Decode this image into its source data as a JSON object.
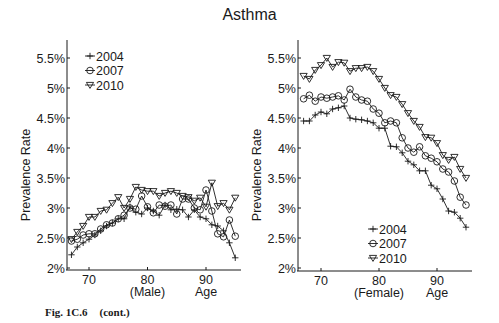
{
  "title": "Asthma",
  "caption": {
    "fig": "Fig. 1C.6",
    "cont": "(cont.)"
  },
  "colors": {
    "line": "#1a1a1a",
    "background": "#ffffff"
  },
  "chart_data": [
    {
      "type": "line",
      "title": "Asthma",
      "panel": "Male",
      "xlabel": "(Male)",
      "xlabel_suffix": "Age",
      "ylabel": "Prevalence Rate",
      "ylim": [
        2,
        5.75
      ],
      "xlim": [
        66,
        96
      ],
      "xticks": [
        70,
        80,
        90
      ],
      "yticks": [
        "2%",
        "2.5%",
        "3%",
        "3.5%",
        "4%",
        "4.5%",
        "5%",
        "5.5%"
      ],
      "grid": false,
      "legend_position": "upper left",
      "x": [
        67,
        68,
        69,
        70,
        71,
        72,
        73,
        74,
        75,
        76,
        77,
        78,
        79,
        80,
        81,
        82,
        83,
        84,
        85,
        86,
        87,
        88,
        89,
        90,
        91,
        92,
        93,
        94,
        95
      ],
      "series": [
        {
          "name": "2004",
          "marker": "plus",
          "values": [
            2.22,
            2.35,
            2.42,
            2.48,
            2.55,
            2.62,
            2.7,
            2.75,
            2.82,
            2.82,
            3.02,
            2.93,
            2.9,
            3.0,
            2.95,
            2.88,
            3.05,
            2.97,
            2.98,
            2.97,
            2.85,
            2.97,
            2.85,
            2.82,
            2.72,
            2.7,
            2.62,
            2.42,
            2.17
          ]
        },
        {
          "name": "2007",
          "marker": "circle",
          "values": [
            2.45,
            2.48,
            2.55,
            2.57,
            2.57,
            2.65,
            2.72,
            2.75,
            2.82,
            2.88,
            3.0,
            2.98,
            3.2,
            3.02,
            2.92,
            3.05,
            3.03,
            3.05,
            2.9,
            3.15,
            3.15,
            3.0,
            2.97,
            3.3,
            2.95,
            2.57,
            2.52,
            2.8,
            2.53
          ]
        },
        {
          "name": "2010",
          "marker": "triangle-down",
          "values": [
            2.48,
            2.6,
            2.7,
            2.85,
            2.85,
            2.95,
            2.97,
            3.08,
            3.18,
            3.0,
            3.15,
            3.35,
            3.3,
            3.28,
            3.28,
            3.2,
            3.25,
            3.28,
            3.25,
            3.2,
            3.18,
            3.12,
            3.17,
            3.02,
            3.42,
            3.03,
            3.08,
            2.97,
            3.17
          ]
        }
      ]
    },
    {
      "type": "line",
      "title": "Asthma",
      "panel": "Female",
      "xlabel": "(Female)",
      "xlabel_suffix": "Age",
      "ylabel": "Prevalence Rate",
      "ylim": [
        2,
        5.75
      ],
      "xlim": [
        66,
        96
      ],
      "xticks": [
        70,
        80,
        90
      ],
      "yticks": [
        "2%",
        "2.5%",
        "3%",
        "3.5%",
        "4%",
        "4.5%",
        "5%",
        "5.5%"
      ],
      "grid": false,
      "legend_position": "lower center",
      "x": [
        67,
        68,
        69,
        70,
        71,
        72,
        73,
        74,
        75,
        76,
        77,
        78,
        79,
        80,
        81,
        82,
        83,
        84,
        85,
        86,
        87,
        88,
        89,
        90,
        91,
        92,
        93,
        94,
        95
      ],
      "series": [
        {
          "name": "2004",
          "marker": "plus",
          "values": [
            4.45,
            4.45,
            4.55,
            4.6,
            4.57,
            4.65,
            4.67,
            4.7,
            4.5,
            4.48,
            4.47,
            4.45,
            4.42,
            4.33,
            4.33,
            4.03,
            4.02,
            3.92,
            3.78,
            3.72,
            3.62,
            3.62,
            3.38,
            3.32,
            3.15,
            2.95,
            2.93,
            2.83,
            2.68
          ]
        },
        {
          "name": "2007",
          "marker": "circle",
          "values": [
            4.82,
            4.88,
            4.78,
            4.85,
            4.83,
            4.85,
            4.87,
            4.8,
            4.98,
            4.85,
            4.8,
            4.78,
            4.65,
            4.58,
            4.42,
            4.45,
            4.42,
            4.17,
            4.0,
            3.93,
            4.02,
            3.87,
            3.83,
            3.77,
            3.65,
            3.6,
            3.45,
            3.18,
            3.05
          ]
        },
        {
          "name": "2010",
          "marker": "triangle-down",
          "values": [
            5.2,
            5.15,
            5.3,
            5.38,
            5.5,
            5.35,
            5.43,
            5.42,
            5.28,
            5.33,
            5.33,
            5.35,
            5.28,
            5.15,
            5.0,
            4.88,
            4.85,
            4.73,
            4.58,
            4.45,
            4.35,
            4.18,
            4.17,
            4.08,
            3.88,
            3.8,
            3.85,
            3.65,
            3.5
          ]
        }
      ]
    }
  ]
}
